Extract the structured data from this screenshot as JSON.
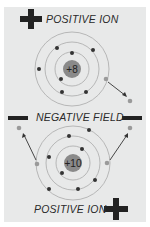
{
  "labels": {
    "top_ion": "POSITIVE ION",
    "field": "NEGATIVE FIELD",
    "bottom_ion": "POSITIVE ION"
  },
  "atoms": {
    "top": {
      "nucleus_charge": "+8",
      "shells": 3
    },
    "bottom": {
      "nucleus_charge": "+10",
      "shells": 3
    }
  },
  "colors": {
    "panel": "#e8e9e9",
    "nucleus": "#8a8a8a",
    "electron": "#333333",
    "free_electron": "#9a9a9a",
    "sign": "#222222"
  }
}
